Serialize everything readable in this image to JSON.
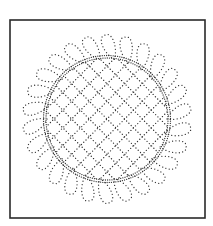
{
  "figure": {
    "background": "#ffffff",
    "ink_color": "#333333",
    "frame": {
      "x": 10,
      "y": 20,
      "width": 195,
      "height": 198,
      "stroke": "#2a2a2a"
    },
    "center": {
      "x": 107,
      "y": 119
    },
    "grid": {
      "type": "diagonal-crosshatch",
      "radius": 61,
      "spacing": 12.5,
      "angles_deg": [
        45,
        -45
      ],
      "dot_gap": 3.2
    },
    "inner_ring": {
      "radius": 61,
      "dot_gap": 2.2
    },
    "loops": {
      "count": 26,
      "inner_radius": 60,
      "outer_radius": 86,
      "width": 14,
      "slant_deg": 28,
      "dot_gap": 3.4
    }
  }
}
